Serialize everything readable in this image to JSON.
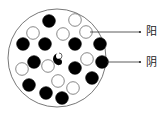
{
  "diagram": {
    "container": {
      "cx": 57,
      "cy": 58,
      "r": 49
    },
    "labels": [
      {
        "text": "阳",
        "x": 146,
        "y": 26,
        "line_from": [
          90,
          32
        ],
        "line_to": [
          140,
          32
        ]
      },
      {
        "text": "阴",
        "x": 146,
        "y": 57,
        "line_from": [
          107,
          62
        ],
        "line_to": [
          140,
          62
        ]
      }
    ],
    "particles": [
      {
        "type": "yin",
        "cx": 49,
        "cy": 21
      },
      {
        "type": "yang",
        "cx": 75,
        "cy": 20
      },
      {
        "type": "yang",
        "cx": 33,
        "cy": 33
      },
      {
        "type": "yang",
        "cx": 63,
        "cy": 34
      },
      {
        "type": "yang",
        "cx": 86,
        "cy": 32
      },
      {
        "type": "yin",
        "cx": 23,
        "cy": 44
      },
      {
        "type": "yin",
        "cx": 45,
        "cy": 44
      },
      {
        "type": "yin",
        "cx": 75,
        "cy": 44
      },
      {
        "type": "yin",
        "cx": 100,
        "cy": 44
      },
      {
        "type": "yin",
        "cx": 34,
        "cy": 62
      },
      {
        "type": "yang",
        "cx": 48,
        "cy": 66
      },
      {
        "type": "yang",
        "cx": 87,
        "cy": 59
      },
      {
        "type": "yin",
        "cx": 102,
        "cy": 62
      },
      {
        "type": "yin",
        "cx": 75,
        "cy": 68
      },
      {
        "type": "yang",
        "cx": 22,
        "cy": 69
      },
      {
        "type": "yin",
        "cx": 92,
        "cy": 78
      },
      {
        "type": "yin",
        "cx": 29,
        "cy": 85
      },
      {
        "type": "yang",
        "cx": 58,
        "cy": 81
      },
      {
        "type": "yang",
        "cx": 73,
        "cy": 88
      },
      {
        "type": "yin",
        "cx": 46,
        "cy": 93
      },
      {
        "type": "yin",
        "cx": 62,
        "cy": 98
      }
    ],
    "center_symbol": {
      "name": "taiji",
      "cx": 59,
      "cy": 59
    },
    "colors": {
      "yin": "#000000",
      "yang": "#ffffff",
      "stroke": "#555555"
    }
  }
}
